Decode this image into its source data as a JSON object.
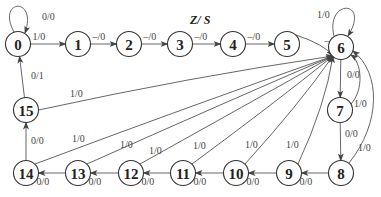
{
  "diagram": {
    "title": "Z/ S",
    "type": "state-transition",
    "nodes": [
      {
        "id": "0",
        "label": "0",
        "x": 18,
        "y": 44
      },
      {
        "id": "1",
        "label": "1",
        "x": 78,
        "y": 44
      },
      {
        "id": "2",
        "label": "2",
        "x": 129,
        "y": 44
      },
      {
        "id": "3",
        "label": "3",
        "x": 180,
        "y": 44
      },
      {
        "id": "4",
        "label": "4",
        "x": 233,
        "y": 44
      },
      {
        "id": "5",
        "label": "5",
        "x": 287,
        "y": 44
      },
      {
        "id": "6",
        "label": "6",
        "x": 341,
        "y": 47
      },
      {
        "id": "7",
        "label": "7",
        "x": 340,
        "y": 110
      },
      {
        "id": "8",
        "label": "8",
        "x": 341,
        "y": 173
      },
      {
        "id": "9",
        "label": "9",
        "x": 289,
        "y": 173
      },
      {
        "id": "10",
        "label": "10",
        "x": 236,
        "y": 173
      },
      {
        "id": "11",
        "label": "11",
        "x": 183,
        "y": 173
      },
      {
        "id": "12",
        "label": "12",
        "x": 131,
        "y": 173
      },
      {
        "id": "13",
        "label": "13",
        "x": 78,
        "y": 173
      },
      {
        "id": "14",
        "label": "14",
        "x": 26,
        "y": 173
      },
      {
        "id": "15",
        "label": "15",
        "x": 26,
        "y": 110
      }
    ],
    "edges": [
      {
        "from": "0",
        "to": "0",
        "label": "0/0"
      },
      {
        "from": "0",
        "to": "1",
        "label": "1/0"
      },
      {
        "from": "1",
        "to": "2",
        "label": "–/0"
      },
      {
        "from": "2",
        "to": "3",
        "label": "–/0"
      },
      {
        "from": "3",
        "to": "4",
        "label": "–/0"
      },
      {
        "from": "4",
        "to": "5",
        "label": "–/0"
      },
      {
        "from": "5",
        "to": "6",
        "label": "–/0"
      },
      {
        "from": "6",
        "to": "6",
        "label": "1/0"
      },
      {
        "from": "6",
        "to": "7",
        "label": "0/0"
      },
      {
        "from": "7",
        "to": "6",
        "label": "1/0"
      },
      {
        "from": "7",
        "to": "8",
        "label": "0/0"
      },
      {
        "from": "8",
        "to": "6",
        "label": "1/0"
      },
      {
        "from": "8",
        "to": "9",
        "label": "0/0"
      },
      {
        "from": "9",
        "to": "6",
        "label": "1/0"
      },
      {
        "from": "9",
        "to": "10",
        "label": "0/0"
      },
      {
        "from": "10",
        "to": "6",
        "label": "1/0"
      },
      {
        "from": "10",
        "to": "11",
        "label": "0/0"
      },
      {
        "from": "11",
        "to": "6",
        "label": "1/0"
      },
      {
        "from": "11",
        "to": "12",
        "label": "0/0"
      },
      {
        "from": "12",
        "to": "6",
        "label": "1/0"
      },
      {
        "from": "12",
        "to": "13",
        "label": "0/0"
      },
      {
        "from": "13",
        "to": "6",
        "label": "1/0"
      },
      {
        "from": "13",
        "to": "14",
        "label": "0/0"
      },
      {
        "from": "14",
        "to": "6",
        "label": "1/0"
      },
      {
        "from": "14",
        "to": "15",
        "label": "0/0"
      },
      {
        "from": "15",
        "to": "6",
        "label": "1/0"
      },
      {
        "from": "15",
        "to": "0",
        "label": "0/1"
      }
    ]
  }
}
